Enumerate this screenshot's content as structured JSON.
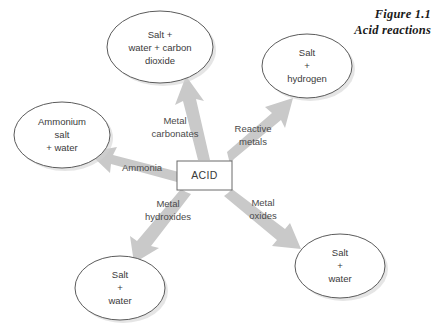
{
  "figure": {
    "caption_line1": "Figure 1.1",
    "caption_line2": "Acid reactions",
    "background_color": "#ffffff",
    "arrow_color": "#c9c9c9",
    "node_stroke_color": "#5b5b5b",
    "text_color": "#3a3a3a"
  },
  "center": {
    "label": "ACID"
  },
  "nodes": [
    {
      "id": "salt-water-carbon-dioxide",
      "lines": [
        "Salt +",
        "water + carbon",
        "dioxide"
      ],
      "cx": 160,
      "cy": 47,
      "rx": 53,
      "ry": 36
    },
    {
      "id": "salt-hydrogen",
      "lines": [
        "Salt",
        "+",
        "hydrogen"
      ],
      "cx": 307,
      "cy": 66,
      "rx": 45,
      "ry": 32
    },
    {
      "id": "ammonium-salt-water",
      "lines": [
        "Ammonium",
        "salt",
        "+ water"
      ],
      "cx": 62,
      "cy": 135,
      "rx": 48,
      "ry": 33
    },
    {
      "id": "salt-water-bottom-left",
      "lines": [
        "Salt",
        "+",
        "water"
      ],
      "cx": 120,
      "cy": 288,
      "rx": 45,
      "ry": 32
    },
    {
      "id": "salt-water-bottom-right",
      "lines": [
        "Salt",
        "+",
        "water"
      ],
      "cx": 340,
      "cy": 266,
      "rx": 45,
      "ry": 32
    }
  ],
  "edges": [
    {
      "id": "metal-carbonates",
      "lines": [
        "Metal",
        "carbonates"
      ],
      "label_x": 175,
      "label_y": 127,
      "from": "ACID",
      "to": "salt-water-carbon-dioxide"
    },
    {
      "id": "reactive-metals",
      "lines": [
        "Reactive",
        "metals"
      ],
      "label_x": 253,
      "label_y": 135,
      "from": "ACID",
      "to": "salt-hydrogen"
    },
    {
      "id": "ammonia",
      "lines": [
        "Ammonia"
      ],
      "label_x": 142,
      "label_y": 168,
      "from": "ACID",
      "to": "ammonium-salt-water"
    },
    {
      "id": "metal-hydroxides",
      "lines": [
        "Metal",
        "hydroxides"
      ],
      "label_x": 168,
      "label_y": 210,
      "from": "ACID",
      "to": "salt-water-bottom-left"
    },
    {
      "id": "metal-oxides",
      "lines": [
        "Metal",
        "oxides"
      ],
      "label_x": 263,
      "label_y": 209,
      "from": "ACID",
      "to": "salt-water-bottom-right"
    }
  ]
}
